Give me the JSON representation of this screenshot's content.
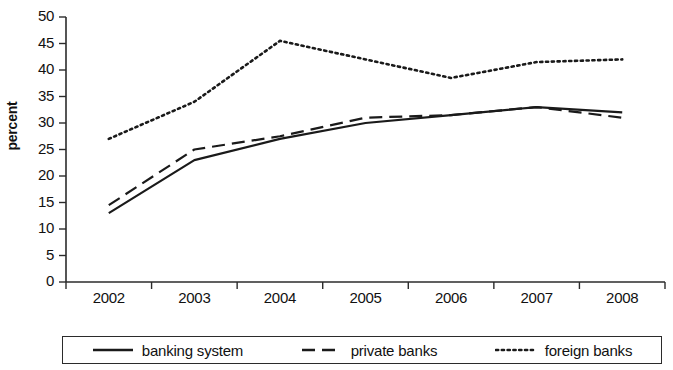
{
  "chart_data": {
    "type": "line",
    "title": "",
    "xlabel": "",
    "ylabel": "percent",
    "categories": [
      "2002",
      "2003",
      "2004",
      "2005",
      "2006",
      "2007",
      "2008"
    ],
    "x": [
      2002,
      2003,
      2004,
      2005,
      2006,
      2007,
      2008
    ],
    "xlim": [
      2002,
      2008
    ],
    "ylim": [
      0,
      50
    ],
    "yticks": [
      0,
      5,
      10,
      15,
      20,
      25,
      30,
      35,
      40,
      45,
      50
    ],
    "ytick_labels": [
      "0",
      "5",
      "10",
      "15",
      "20",
      "25",
      "30",
      "35",
      "40",
      "45",
      "50"
    ],
    "grid": false,
    "legend_position": "bottom",
    "series": [
      {
        "name": "banking system",
        "style": "solid",
        "color": "#1a1a1a",
        "values": [
          13,
          23,
          27,
          30,
          31.5,
          33,
          32
        ]
      },
      {
        "name": "private banks",
        "style": "dashed",
        "color": "#1a1a1a",
        "values": [
          14.5,
          25,
          27.5,
          31,
          31.5,
          33,
          31
        ]
      },
      {
        "name": "foreign banks",
        "style": "dotted",
        "color": "#1a1a1a",
        "values": [
          27,
          34,
          45.5,
          42,
          38.5,
          41.5,
          42
        ]
      }
    ]
  },
  "axis": {
    "y_title": "percent"
  },
  "legend": {
    "items": [
      {
        "label": "banking system",
        "style": "solid"
      },
      {
        "label": "private banks",
        "style": "dashed"
      },
      {
        "label": "foreign banks",
        "style": "dotted"
      }
    ]
  }
}
